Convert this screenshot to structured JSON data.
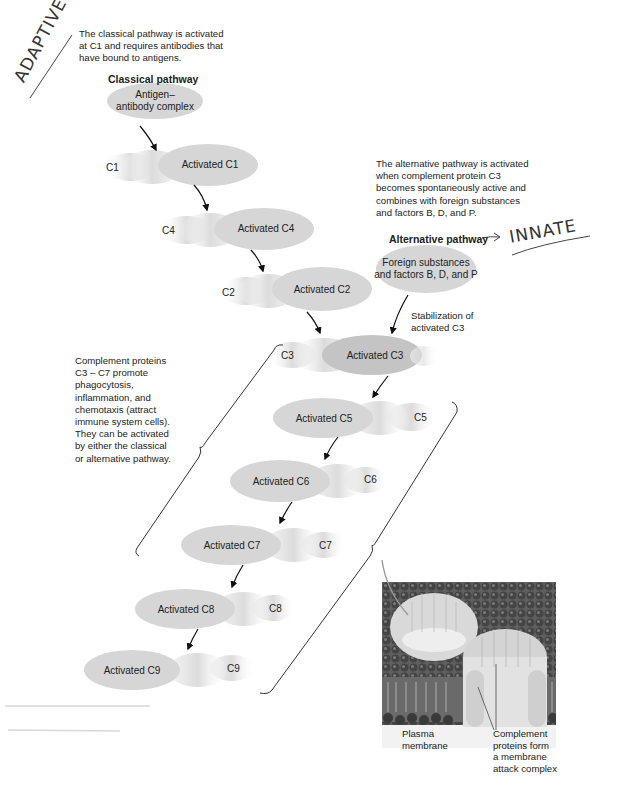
{
  "annotations": {
    "handwritten_left": "ADAPTIVE",
    "handwritten_right": "INNATE",
    "handwritten_arrow": "→"
  },
  "classical": {
    "description": [
      "The classical pathway is activated",
      "at C1 and requires antibodies that",
      "have bound to antigens."
    ],
    "title": "Classical pathway",
    "start_node": [
      "Antigen–",
      "antibody complex"
    ],
    "steps": [
      {
        "inactive": "C1",
        "active": "Activated C1"
      },
      {
        "inactive": "C4",
        "active": "Activated C4"
      },
      {
        "inactive": "C2",
        "active": "Activated C2"
      }
    ]
  },
  "alternative": {
    "description": [
      "The alternative pathway is activated",
      "when complement protein C3",
      "becomes spontaneously active and",
      "combines with foreign substances",
      "and factors B, D, and P."
    ],
    "title": "Alternative pathway",
    "start_node": [
      "Foreign substances",
      "and factors B, D, and P"
    ],
    "stabilization": [
      "Stabilization of",
      "activated C3"
    ]
  },
  "common": {
    "steps": [
      {
        "inactive": "C3",
        "active": "Activated C3"
      },
      {
        "inactive": "C5",
        "active": "Activated C5"
      },
      {
        "inactive": "C6",
        "active": "Activated C6"
      },
      {
        "inactive": "C7",
        "active": "Activated C7"
      },
      {
        "inactive": "C8",
        "active": "Activated C8"
      },
      {
        "inactive": "C9",
        "active": "Activated C9"
      }
    ],
    "note": [
      "Complement proteins",
      "C3 – C7 promote",
      "phagocytosis,",
      "inflammation, and",
      "chemotaxis (attract",
      "immune system cells).",
      "They can be activated",
      "by either the classical",
      "or alternative pathway."
    ]
  },
  "illustration": {
    "label_membrane": [
      "Plasma",
      "membrane"
    ],
    "label_complex": [
      "Complement",
      "proteins form",
      "a membrane",
      "attack complex"
    ]
  },
  "colors": {
    "ellipse_fill": "#d6d6d6",
    "ellipse_dark": "#c4c4c4",
    "arrow": "#111111",
    "membrane": "#5f5f5f"
  }
}
